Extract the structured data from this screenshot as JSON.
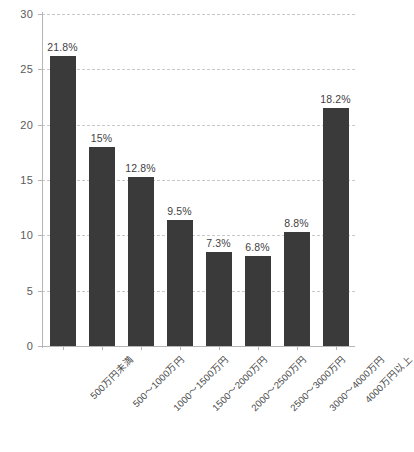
{
  "chart_data": {
    "type": "bar",
    "title": "",
    "subtitle": "",
    "xlabel": "",
    "ylabel": "",
    "ylim": [
      0,
      30
    ],
    "ytick_values": [
      0,
      5,
      10,
      15,
      20,
      25,
      30
    ],
    "ytick_labels": [
      "0",
      "5",
      "10",
      "15",
      "20",
      "25",
      "30"
    ],
    "grid": true,
    "legend": "none",
    "categories": [
      "500万円未満",
      "500〜1000万円",
      "1000〜1500万円",
      "1500〜2000万円",
      "2000〜2500万円",
      "2500〜3000万円",
      "3000〜4000万円",
      "4000万円以上"
    ],
    "values": [
      26.2,
      18.0,
      15.3,
      11.4,
      8.5,
      8.1,
      10.3,
      21.5
    ],
    "data_labels": [
      "21.8%",
      "15%",
      "12.8%",
      "9.5%",
      "7.3%",
      "6.8%",
      "8.8%",
      "18.2%"
    ],
    "bar_color": "#3a3a3a",
    "gridline_color": "#c9c9c9",
    "axis_color": "#b5b5b5",
    "label_color": "#5a5a5a"
  }
}
